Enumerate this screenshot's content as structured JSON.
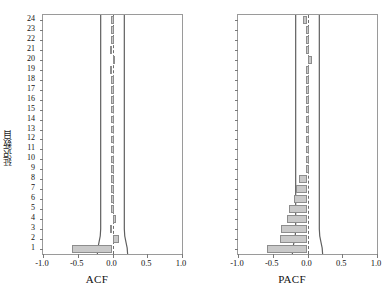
{
  "figure": {
    "y_axis_label": "延迟数目",
    "lag_ticks": [
      24,
      23,
      22,
      21,
      20,
      19,
      18,
      17,
      16,
      15,
      14,
      13,
      12,
      11,
      10,
      9,
      8,
      7,
      6,
      5,
      4,
      3,
      2,
      1
    ],
    "x_ticks": [
      "-1.0",
      "-0.5",
      "0.0",
      "0.5",
      "1.0"
    ],
    "x_tick_values": [
      -1.0,
      -0.5,
      0.0,
      0.5,
      1.0
    ],
    "bar_fill_color": "#c9c9c9",
    "bar_border_color": "#8d8d8d",
    "frame_color": "#9a9a9a",
    "zero_line_color": "#6e6e6e",
    "confidence_line_color": "#5f5f5f"
  },
  "chart_data": [
    {
      "type": "bar",
      "orientation": "horizontal",
      "title": "",
      "xlabel": "ACF",
      "ylabel": "延迟数目",
      "xlim": [
        -1.0,
        1.0
      ],
      "grid": false,
      "legend": "none",
      "categories": [
        1,
        2,
        3,
        4,
        5,
        6,
        7,
        8,
        9,
        10,
        11,
        12,
        13,
        14,
        15,
        16,
        17,
        18,
        19,
        20,
        21,
        22,
        23,
        24
      ],
      "values": [
        -0.58,
        0.1,
        -0.04,
        0.05,
        -0.02,
        0.01,
        -0.02,
        -0.01,
        -0.01,
        -0.02,
        0.0,
        0.0,
        0.0,
        0.0,
        0.0,
        0.0,
        0.0,
        0.0,
        -0.04,
        0.04,
        -0.04,
        -0.01,
        0.0,
        0.0
      ],
      "confidence_bound": 0.17
    },
    {
      "type": "bar",
      "orientation": "horizontal",
      "title": "",
      "xlabel": "PACF",
      "ylabel": "延迟数目",
      "xlim": [
        -1.0,
        1.0
      ],
      "grid": false,
      "legend": "none",
      "categories": [
        1,
        2,
        3,
        4,
        5,
        6,
        7,
        8,
        9,
        10,
        11,
        12,
        13,
        14,
        15,
        16,
        17,
        18,
        19,
        20,
        21,
        22,
        23,
        24
      ],
      "values": [
        -0.58,
        -0.4,
        -0.38,
        -0.3,
        -0.26,
        -0.2,
        -0.16,
        -0.12,
        -0.01,
        -0.01,
        -0.01,
        -0.01,
        -0.01,
        -0.01,
        -0.01,
        -0.01,
        -0.01,
        -0.01,
        -0.01,
        0.07,
        -0.02,
        -0.01,
        -0.01,
        -0.06
      ],
      "confidence_bound": 0.17
    }
  ]
}
